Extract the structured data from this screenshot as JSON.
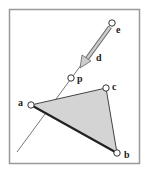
{
  "diagram": {
    "points": {
      "e": {
        "label": "e",
        "x": 112,
        "y": 23
      },
      "p": {
        "label": "p",
        "x": 71,
        "y": 78
      },
      "a": {
        "label": "a",
        "x": 31,
        "y": 105
      },
      "b": {
        "label": "b",
        "x": 117,
        "y": 153
      },
      "c": {
        "label": "c",
        "x": 106,
        "y": 88
      }
    },
    "direction_label": "d",
    "colors": {
      "frame": "#999999",
      "triangle_fill": "#d4d4d4",
      "edge": "#222222",
      "ray": "#555555"
    }
  }
}
